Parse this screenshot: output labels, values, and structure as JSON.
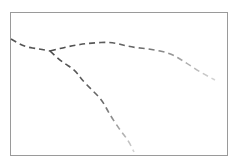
{
  "diagram": {
    "frame": {
      "x": 10,
      "y": 12,
      "width": 218,
      "height": 144,
      "border_color": "#9a9a9a"
    },
    "branches": [
      {
        "name": "trunk",
        "color": "#555555",
        "opacity": 0.9,
        "points": [
          [
            11,
            39
          ],
          [
            25,
            47
          ],
          [
            40,
            49
          ],
          [
            50,
            51
          ]
        ]
      },
      {
        "name": "upper-branch",
        "color": "#555555",
        "fade_to": "#cfcfcf",
        "points": [
          [
            50,
            51
          ],
          [
            70,
            46
          ],
          [
            90,
            43
          ],
          [
            112,
            42
          ],
          [
            130,
            47
          ],
          [
            150,
            49
          ],
          [
            170,
            53
          ],
          [
            185,
            62
          ],
          [
            200,
            72
          ],
          [
            215,
            80
          ]
        ]
      },
      {
        "name": "lower-branch",
        "color": "#555555",
        "fade_to": "#cfcfcf",
        "points": [
          [
            50,
            51
          ],
          [
            62,
            62
          ],
          [
            75,
            70
          ],
          [
            82,
            80
          ],
          [
            92,
            90
          ],
          [
            102,
            100
          ],
          [
            110,
            115
          ],
          [
            120,
            130
          ],
          [
            128,
            140
          ],
          [
            134,
            152
          ]
        ]
      }
    ],
    "dash_pattern": "6 4"
  }
}
